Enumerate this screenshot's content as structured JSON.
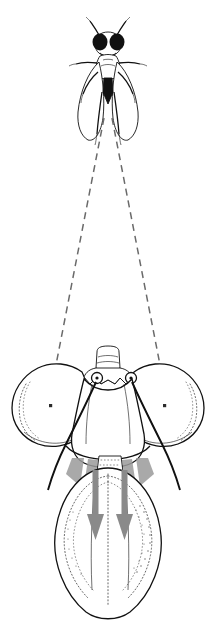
{
  "figure": {
    "background_color": "#ffffff",
    "width": 216,
    "height": 640,
    "caption": "",
    "style": "scientific line drawing, ink on white"
  },
  "colors": {
    "ink": "#111111",
    "arrow_gray": "#8a8a8a",
    "gusset_gray": "#9a9a9a",
    "sightline_gray": "#6a6a6a",
    "stipple": "#2b2b2b",
    "background": "#ffffff"
  },
  "parts": {
    "prey_fly": {
      "label": "prey fly (dorsal view)",
      "description": "small fly drawn in dorsal aspect at top of figure",
      "components": [
        "head with two large black compound eyes",
        "pair of antennae",
        "thorax",
        "two outspread wings",
        "dark triangular abdomen",
        "three pairs of legs"
      ],
      "center_x": 108,
      "top_y": 18,
      "bottom_y": 140
    },
    "sight_lines": {
      "label": "lines of sight",
      "style": "dashed",
      "count": 2,
      "apex_x": 108,
      "apex_y": 120,
      "left_end_x": 55,
      "left_end_y": 368,
      "right_end_x": 161,
      "right_end_y": 368
    },
    "head": {
      "label": "fly head (frontal view)",
      "components": [
        "left compound eye",
        "right compound eye",
        "vertex",
        "frons",
        "antennal bases",
        "antennae",
        "face",
        "oral margin",
        "proboscis"
      ]
    },
    "left_eye": {
      "label": "left compound eye",
      "center_x": 51,
      "center_y": 400,
      "radius_x": 44,
      "radius_y": 40,
      "facet_spot": true
    },
    "right_eye": {
      "label": "right compound eye",
      "center_x": 165,
      "center_y": 400,
      "radius_x": 44,
      "radius_y": 40,
      "facet_spot": true
    },
    "antennae": {
      "label": "antennae",
      "count": 2,
      "base_left_x": 97,
      "base_left_y": 377,
      "base_right_x": 131,
      "base_right_y": 377,
      "direction": "downward and outward past the eyes"
    },
    "proboscis": {
      "label": "proboscis / labium",
      "top_y": 470,
      "bottom_y": 600,
      "outline": "dome with fine stippled inner ridges"
    },
    "arrows": {
      "label": "direction-of-movement arrows",
      "count": 2,
      "color": "#8a8a8a",
      "direction": "down",
      "left_arrow_x": 96,
      "right_arrow_x": 124,
      "start_y": 472,
      "end_y": 540
    },
    "gussets": {
      "label": "oral membrane gussets",
      "count": 4,
      "color": "#9a9a9a"
    }
  }
}
